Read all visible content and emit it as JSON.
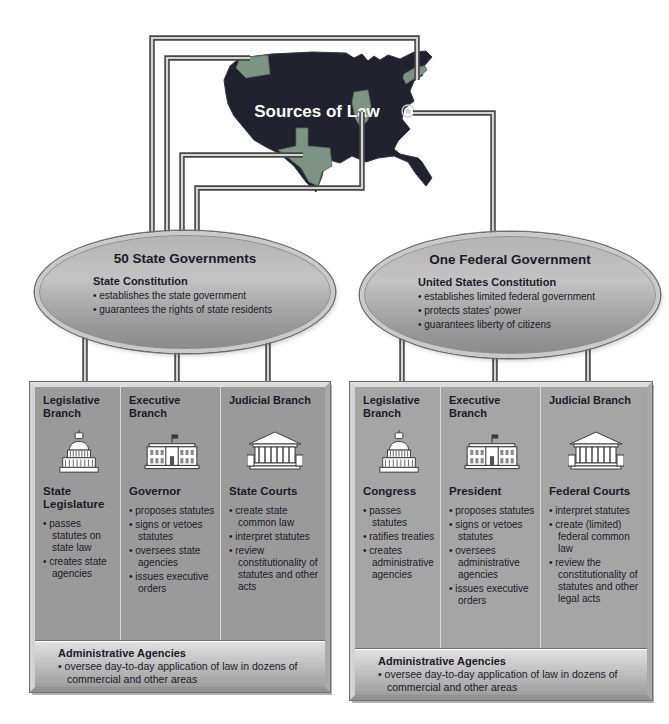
{
  "diagram_title": "Sources of Law",
  "colors": {
    "map_fill": "#20232e",
    "highlighted_state": "#7d9383",
    "panel_gray_state": "#9a9a9a",
    "panel_gray_federal": "#a5a5a5",
    "oval_gray": "#a9a9a9",
    "text": "#1b1b28",
    "connector_dark": "#474747",
    "connector_light": "#d4d4d4"
  },
  "map": {
    "label": "Sources of Law",
    "capital_marker": "dc-star",
    "highlighted_regions": [
      "washington",
      "texas",
      "illinois",
      "new-york"
    ]
  },
  "state_government": {
    "oval_title": "50 State Governments",
    "constitution_heading": "State Constitution",
    "constitution_bullets": [
      "establishes the state government",
      "guarantees the rights of state residents"
    ],
    "branches": [
      {
        "title": "Legislative Branch",
        "icon": "capitol-icon",
        "institution": "State Legislature",
        "powers": [
          "passes statutes on state law",
          "creates state agencies"
        ]
      },
      {
        "title": "Executive Branch",
        "icon": "white-house-icon",
        "institution": "Governor",
        "powers": [
          "proposes statutes",
          "signs or vetoes statutes",
          "oversees state agencies",
          "issues executive orders"
        ]
      },
      {
        "title": "Judicial Branch",
        "icon": "courthouse-icon",
        "institution": "State Courts",
        "powers": [
          "create state common law",
          "interpret statutes",
          "review constitutionality of statutes and other acts"
        ]
      }
    ],
    "admin_heading": "Administrative Agencies",
    "admin_bullets": [
      "oversee day-to-day application of law in dozens of commercial and other areas"
    ]
  },
  "federal_government": {
    "oval_title": "One Federal Government",
    "constitution_heading": "United States Constitution",
    "constitution_bullets": [
      "establishes limited federal government",
      "protects states' power",
      "guarantees liberty of citizens"
    ],
    "branches": [
      {
        "title": "Legislative Branch",
        "icon": "capitol-icon",
        "institution": "Congress",
        "powers": [
          "passes statutes",
          "ratifies treaties",
          "creates administrative agencies"
        ]
      },
      {
        "title": "Executive Branch",
        "icon": "white-house-icon",
        "institution": "President",
        "powers": [
          "proposes statutes",
          "signs or vetoes statutes",
          "oversees administrative agencies",
          "issues executive orders"
        ]
      },
      {
        "title": "Judicial Branch",
        "icon": "courthouse-icon",
        "institution": "Federal Courts",
        "powers": [
          "interpret statutes",
          "create (limited) federal common law",
          "review the constitutionality of statutes and other legal acts"
        ]
      }
    ],
    "admin_heading": "Administrative Agencies",
    "admin_bullets": [
      "oversee day-to-day application of law in dozens of commercial and other areas"
    ]
  }
}
